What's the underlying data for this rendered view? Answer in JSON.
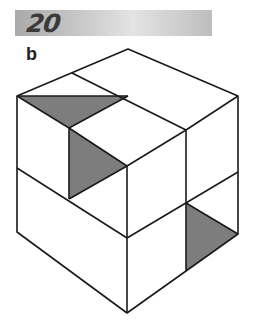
{
  "header": {
    "number": "20"
  },
  "figure": {
    "label": "b",
    "colors": {
      "stroke": "#1a1a1a",
      "shade": "#7d7d7d",
      "fill": "#ffffff"
    }
  }
}
